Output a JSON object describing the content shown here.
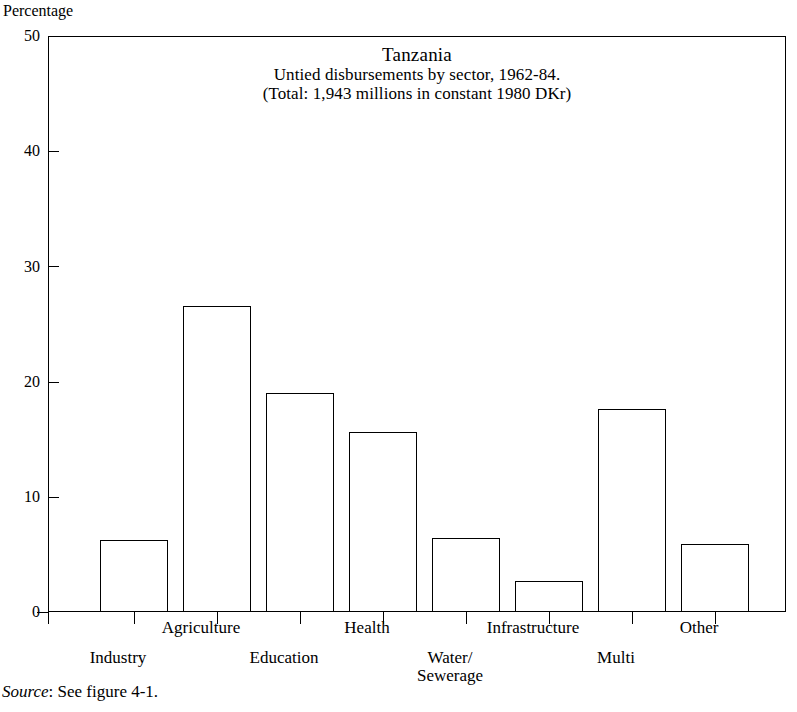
{
  "figure": {
    "y_axis_title": "Percentage",
    "source_note": {
      "label": "Source",
      "text": ": See figure 4-1."
    }
  },
  "chart_data": {
    "type": "bar",
    "title": "Tanzania",
    "subtitle_line1": "Untied disbursements by sector, 1962-84.",
    "subtitle_line2": "(Total: 1,943 millions in constant 1980 DKr)",
    "xlabel": "",
    "ylabel": "Percentage",
    "ylim": [
      0,
      50
    ],
    "yticks": [
      0,
      10,
      20,
      30,
      40,
      50
    ],
    "ytick_labels": [
      "0",
      "10",
      "20",
      "30",
      "40",
      "50"
    ],
    "grid": false,
    "legend": "none",
    "categories": [
      "Industry",
      "Agriculture",
      "Education",
      "Health",
      "Water/\nSewerage",
      "Infrastructure",
      "Multi",
      "Other"
    ],
    "category_labels": [
      {
        "text": "Industry",
        "row": "b"
      },
      {
        "text": "Agriculture",
        "row": "a"
      },
      {
        "text": "Education",
        "row": "b"
      },
      {
        "text": "Health",
        "row": "a"
      },
      {
        "text": "Water/ Sewerage",
        "row": "b"
      },
      {
        "text": "Infrastructure",
        "row": "a"
      },
      {
        "text": "Multi",
        "row": "b"
      },
      {
        "text": "Other",
        "row": "a"
      }
    ],
    "values": [
      6.25,
      26.6,
      19.0,
      15.6,
      6.4,
      2.7,
      17.6,
      5.9
    ],
    "series": [
      {
        "name": "Untied disbursements share",
        "values": [
          6.25,
          26.6,
          19.0,
          15.6,
          6.4,
          2.7,
          17.6,
          5.9
        ]
      }
    ],
    "bar_color": "#ffffff",
    "bar_edge_color": "#000000",
    "total_label": "1,943 millions in constant 1980 DKr",
    "period": "1962-84",
    "country": "Tanzania"
  },
  "y_tick_items": [
    {
      "label": "50",
      "value": 50
    },
    {
      "label": "40",
      "value": 40
    },
    {
      "label": "30",
      "value": 30
    },
    {
      "label": "20",
      "value": 20
    },
    {
      "label": "10",
      "value": 10
    },
    {
      "label": "0",
      "value": 0
    }
  ],
  "x_labels": {
    "industry": "Industry",
    "agriculture": "Agriculture",
    "education": "Education",
    "health": "Health",
    "water_line1": "Water/",
    "water_line2": "Sewerage",
    "infrastructure": "Infrastructure",
    "multi": "Multi",
    "other": "Other"
  }
}
